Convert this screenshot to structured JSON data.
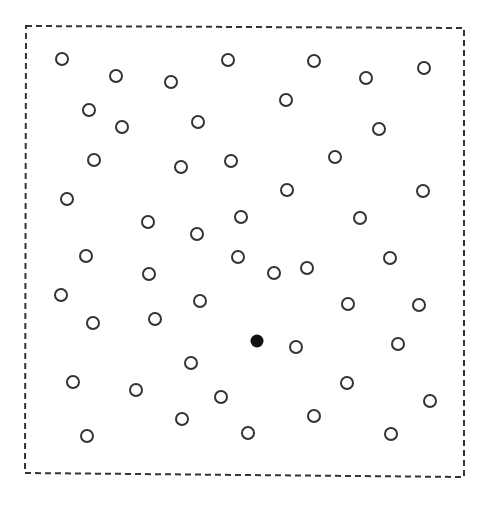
{
  "figure": {
    "width": 486,
    "height": 505,
    "frame": {
      "points": [
        [
          26,
          26
        ],
        [
          464,
          28
        ],
        [
          464,
          477
        ],
        [
          25,
          473
        ]
      ],
      "stroke": "#333333",
      "dash": "6,4",
      "stroke_width": 2
    },
    "circle_radius": 6,
    "open_point_stroke": "#333333",
    "filled_point_color": "#111111",
    "open_points": [
      [
        62,
        59
      ],
      [
        116,
        76
      ],
      [
        171,
        82
      ],
      [
        228,
        60
      ],
      [
        314,
        61
      ],
      [
        366,
        78
      ],
      [
        424,
        68
      ],
      [
        89,
        110
      ],
      [
        122,
        127
      ],
      [
        198,
        122
      ],
      [
        286,
        100
      ],
      [
        379,
        129
      ],
      [
        94,
        160
      ],
      [
        181,
        167
      ],
      [
        231,
        161
      ],
      [
        335,
        157
      ],
      [
        67,
        199
      ],
      [
        287,
        190
      ],
      [
        423,
        191
      ],
      [
        148,
        222
      ],
      [
        241,
        217
      ],
      [
        197,
        234
      ],
      [
        360,
        218
      ],
      [
        86,
        256
      ],
      [
        149,
        274
      ],
      [
        238,
        257
      ],
      [
        274,
        273
      ],
      [
        307,
        268
      ],
      [
        390,
        258
      ],
      [
        61,
        295
      ],
      [
        200,
        301
      ],
      [
        348,
        304
      ],
      [
        419,
        305
      ],
      [
        93,
        323
      ],
      [
        155,
        319
      ],
      [
        296,
        347
      ],
      [
        398,
        344
      ],
      [
        191,
        363
      ],
      [
        73,
        382
      ],
      [
        136,
        390
      ],
      [
        221,
        397
      ],
      [
        347,
        383
      ],
      [
        430,
        401
      ],
      [
        182,
        419
      ],
      [
        314,
        416
      ],
      [
        87,
        436
      ],
      [
        248,
        433
      ],
      [
        391,
        434
      ]
    ],
    "filled_points": [
      [
        257,
        341
      ]
    ]
  }
}
